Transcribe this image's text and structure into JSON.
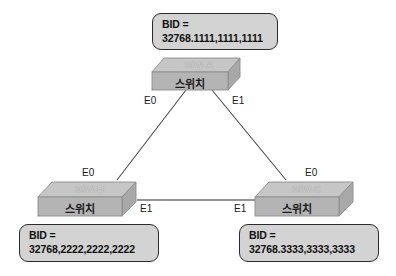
{
  "diagram": {
    "background_color": "#ffffff"
  },
  "colors": {
    "box_fill": "#d3d3d3",
    "box_border": "#2b2b2b",
    "switch_top_face": "#c6c6c6",
    "switch_front_face": "#b4b4b4",
    "switch_side_face": "#a8a8a8",
    "switch_edge": "#7d7d7d",
    "link_line": "#4a4a4a",
    "text_dark": "#101010",
    "text_ghost": "#c9c9c9"
  },
  "switches": [
    {
      "id": "switch-a",
      "top_label": "S/W-A",
      "front_label": "스위치",
      "bid_label": "BID =",
      "bid_value": "32768.1111,1111,1111",
      "ports": [
        {
          "name": "E0",
          "label": "E0"
        },
        {
          "name": "E1",
          "label": "E1"
        }
      ]
    },
    {
      "id": "switch-b",
      "top_label": "S/W-B",
      "front_label": "스위치",
      "bid_label": "BID =",
      "bid_value": "32768,2222,2222,2222",
      "ports": [
        {
          "name": "E0",
          "label": "E0"
        },
        {
          "name": "E1",
          "label": "E1"
        }
      ]
    },
    {
      "id": "switch-c",
      "top_label": "S/W-C",
      "front_label": "스위치",
      "bid_label": "BID =",
      "bid_value": "32768.3333,3333,3333",
      "ports": [
        {
          "name": "E0",
          "label": "E0"
        },
        {
          "name": "E1",
          "label": "E1"
        }
      ]
    }
  ],
  "links": [
    {
      "name": "link-a-e0-to-b-e0",
      "from": "switch-a:E0",
      "to": "switch-b:E0"
    },
    {
      "name": "link-a-e1-to-c-e0",
      "from": "switch-a:E1",
      "to": "switch-c:E0"
    },
    {
      "name": "link-b-e1-to-c-e1",
      "from": "switch-b:E1",
      "to": "switch-c:E1"
    }
  ]
}
